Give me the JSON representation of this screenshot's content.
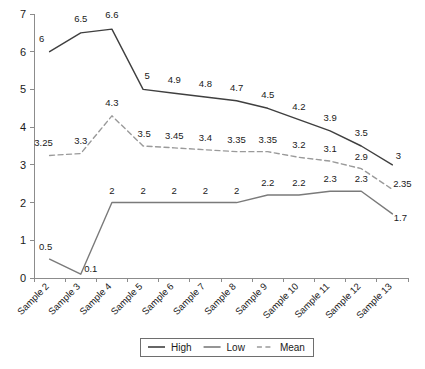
{
  "chart_data": {
    "type": "line",
    "title": "",
    "subtitle": "",
    "xlabel": "",
    "ylabel": "",
    "ylim": [
      0,
      7
    ],
    "ytick_labels": [
      "0",
      "1",
      "2",
      "3",
      "4",
      "5",
      "6",
      "7"
    ],
    "ytick_values": [
      0,
      1,
      2,
      3,
      4,
      5,
      6,
      7
    ],
    "grid": false,
    "legend_position": "bottom-center",
    "categories": [
      "Sample 2",
      "Sample 3",
      "Sample 4",
      "Sample 5",
      "Sample 6",
      "Sample 7",
      "Sample 8",
      "Sample 9",
      "Sample 10",
      "Sample 11",
      "Sample 12",
      "Sample 13"
    ],
    "series": [
      {
        "name": "High",
        "style": "solid",
        "color": "#3f3f3f",
        "values": [
          6,
          6.5,
          6.6,
          5,
          4.9,
          4.8,
          4.7,
          4.5,
          4.2,
          3.9,
          3.5,
          3
        ],
        "labels": [
          "6",
          "6.5",
          "6.6",
          "5",
          "4.9",
          "4.8",
          "4.7",
          "4.5",
          "4.2",
          "3.9",
          "3.5",
          "3"
        ]
      },
      {
        "name": "Low",
        "style": "solid",
        "color": "#7a7a7a",
        "values": [
          0.5,
          0.1,
          2,
          2,
          2,
          2,
          2,
          2.2,
          2.2,
          2.3,
          2.3,
          1.7
        ],
        "labels": [
          "0.5",
          "0.1",
          "2",
          "2",
          "2",
          "2",
          "2",
          "2.2",
          "2.2",
          "2.3",
          "2.3",
          "1.7"
        ]
      },
      {
        "name": "Mean",
        "style": "dashed",
        "color": "#9a9a9a",
        "values": [
          3.25,
          3.3,
          4.3,
          3.5,
          3.45,
          3.4,
          3.35,
          3.35,
          3.2,
          3.1,
          2.9,
          2.35
        ],
        "labels": [
          "3.25",
          "3.3",
          "4.3",
          "3.5",
          "3.45",
          "3.4",
          "3.35",
          "3.35",
          "3.2",
          "3.1",
          "2.9",
          "2.35"
        ]
      }
    ],
    "label_offsets": {
      "High": [
        [
          -8,
          -10
        ],
        [
          0,
          -11
        ],
        [
          0,
          -11
        ],
        [
          4,
          -10
        ],
        [
          0,
          -10
        ],
        [
          0,
          -10
        ],
        [
          0,
          -10
        ],
        [
          0,
          -10
        ],
        [
          0,
          -10
        ],
        [
          0,
          -10
        ],
        [
          0,
          -10
        ],
        [
          6,
          -6
        ]
      ],
      "Low": [
        [
          -4,
          -9
        ],
        [
          10,
          -2
        ],
        [
          0,
          -9
        ],
        [
          0,
          -9
        ],
        [
          0,
          -9
        ],
        [
          0,
          -9
        ],
        [
          0,
          -9
        ],
        [
          0,
          -9
        ],
        [
          0,
          -9
        ],
        [
          0,
          -9
        ],
        [
          0,
          -9
        ],
        [
          8,
          7
        ]
      ],
      "Mean": [
        [
          -6,
          -9
        ],
        [
          0,
          -10
        ],
        [
          0,
          -10
        ],
        [
          1,
          -9
        ],
        [
          0,
          -9
        ],
        [
          0,
          -9
        ],
        [
          0,
          -9
        ],
        [
          0,
          -9
        ],
        [
          0,
          -9
        ],
        [
          0,
          -9
        ],
        [
          0,
          -9
        ],
        [
          10,
          -2
        ]
      ]
    }
  },
  "legend": {
    "items": [
      {
        "label": "High",
        "color": "#3f3f3f",
        "style": "solid"
      },
      {
        "label": "Low",
        "color": "#7a7a7a",
        "style": "solid"
      },
      {
        "label": "Mean",
        "color": "#9a9a9a",
        "style": "dashed"
      }
    ]
  },
  "colors": {
    "background": "#ffffff",
    "axis": "#8c8c8c",
    "text": "#1a1a1a",
    "high": "#3f3f3f",
    "low": "#7a7a7a",
    "mean": "#9a9a9a"
  },
  "geometry": {
    "plot_left": 34,
    "plot_right": 408,
    "plot_top": 14,
    "plot_bottom": 278
  }
}
